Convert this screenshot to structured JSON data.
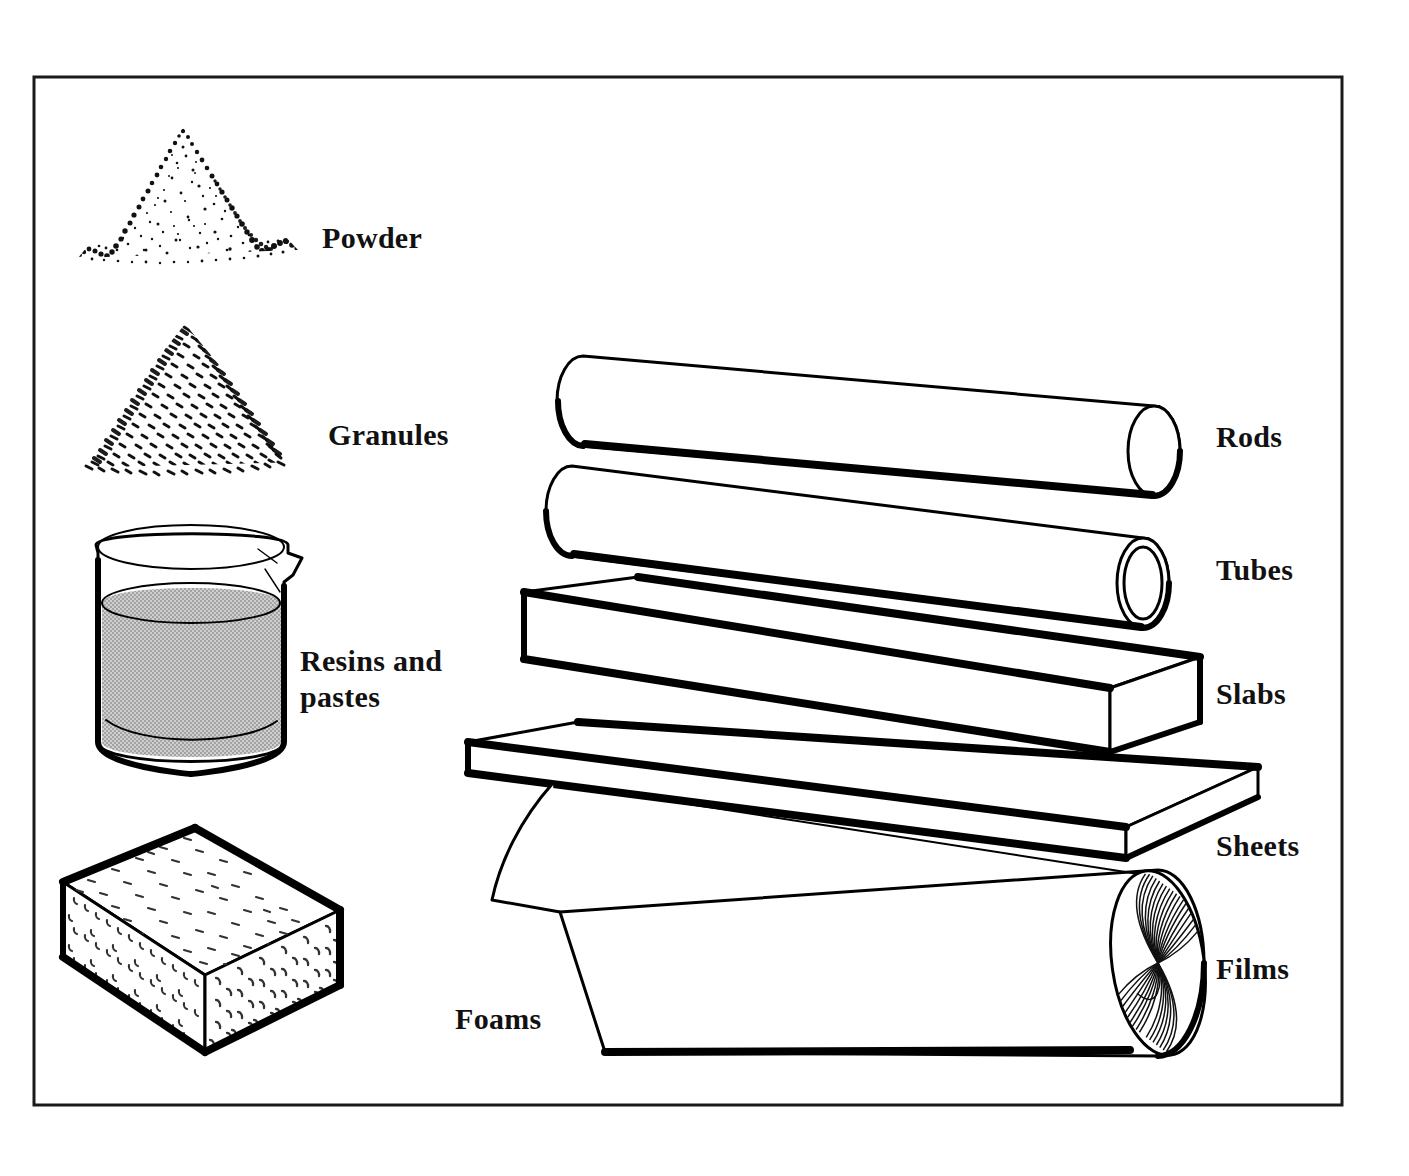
{
  "figure": {
    "background_color": "#ffffff",
    "ink_color": "#000000",
    "frame": {
      "name": "figure-border",
      "x": 34,
      "y": 77,
      "width": 1308,
      "height": 1028,
      "stroke_color": "#1a1a1a"
    },
    "liquid_fill_color": "#b8b8b8"
  },
  "labels": {
    "powder": "Powder",
    "granules": "Granules",
    "resins_line1": "Resins and",
    "resins_line2": "pastes",
    "foams": "Foams",
    "rods": "Rods",
    "tubes": "Tubes",
    "slabs": "Slabs",
    "sheets": "Sheets",
    "films": "Films"
  },
  "items": [
    {
      "id": "powder",
      "label": "Powder",
      "icon": "powder-heap-icon",
      "column": "left",
      "label_x": 322,
      "label_y": 248
    },
    {
      "id": "granules",
      "label": "Granules",
      "icon": "granules-heap-icon",
      "column": "left",
      "label_x": 328,
      "label_y": 445
    },
    {
      "id": "resins-and-pastes",
      "label": "Resins and pastes",
      "icon": "beaker-icon",
      "column": "left",
      "label_x": 300,
      "label_y": 671
    },
    {
      "id": "foams",
      "label": "Foams",
      "icon": "foam-block-icon",
      "column": "left",
      "label_x": 455,
      "label_y": 1029
    },
    {
      "id": "rods",
      "label": "Rods",
      "icon": "solid-cylinder-icon",
      "column": "right",
      "label_x": 1216,
      "label_y": 447
    },
    {
      "id": "tubes",
      "label": "Tubes",
      "icon": "hollow-cylinder-icon",
      "column": "right",
      "label_x": 1216,
      "label_y": 580
    },
    {
      "id": "slabs",
      "label": "Slabs",
      "icon": "thick-block-icon",
      "column": "right",
      "label_x": 1216,
      "label_y": 704
    },
    {
      "id": "sheets",
      "label": "Sheets",
      "icon": "thin-plate-icon",
      "column": "right",
      "label_x": 1216,
      "label_y": 856
    },
    {
      "id": "films",
      "label": "Films",
      "icon": "film-roll-icon",
      "column": "right",
      "label_x": 1216,
      "label_y": 979
    }
  ]
}
